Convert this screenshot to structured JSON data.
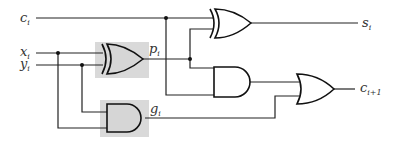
{
  "diagram": {
    "title": "",
    "type": "full-adder-logic-circuit",
    "colors": {
      "wire": "#222222",
      "shading": "#d9d9d9",
      "background": "#ffffff"
    },
    "inputs": [
      {
        "name": "c",
        "subscript": "i"
      },
      {
        "name": "x",
        "subscript": "i"
      },
      {
        "name": "y",
        "subscript": "i"
      }
    ],
    "outputs": [
      {
        "name": "s",
        "subscript": "i"
      },
      {
        "name": "c",
        "subscript": "i+1"
      }
    ],
    "internal_signals": [
      {
        "name": "p",
        "subscript": "i"
      },
      {
        "name": "g",
        "subscript": "i"
      }
    ],
    "gates": [
      {
        "id": "xor-p",
        "type": "XOR",
        "shaded": true,
        "inputs": [
          "x_i",
          "y_i"
        ],
        "output": "p_i"
      },
      {
        "id": "and-g",
        "type": "AND",
        "shaded": true,
        "inputs": [
          "y_i",
          "x_i"
        ],
        "output": "g_i"
      },
      {
        "id": "xor-s",
        "type": "XOR",
        "shaded": false,
        "inputs": [
          "c_i",
          "p_i"
        ],
        "output": "s_i"
      },
      {
        "id": "and-pc",
        "type": "AND",
        "shaded": false,
        "inputs": [
          "p_i",
          "c_i"
        ],
        "output": "p_i·c_i"
      },
      {
        "id": "or-c",
        "type": "OR",
        "shaded": false,
        "inputs": [
          "p_i·c_i",
          "g_i"
        ],
        "output": "c_i+1"
      }
    ]
  }
}
